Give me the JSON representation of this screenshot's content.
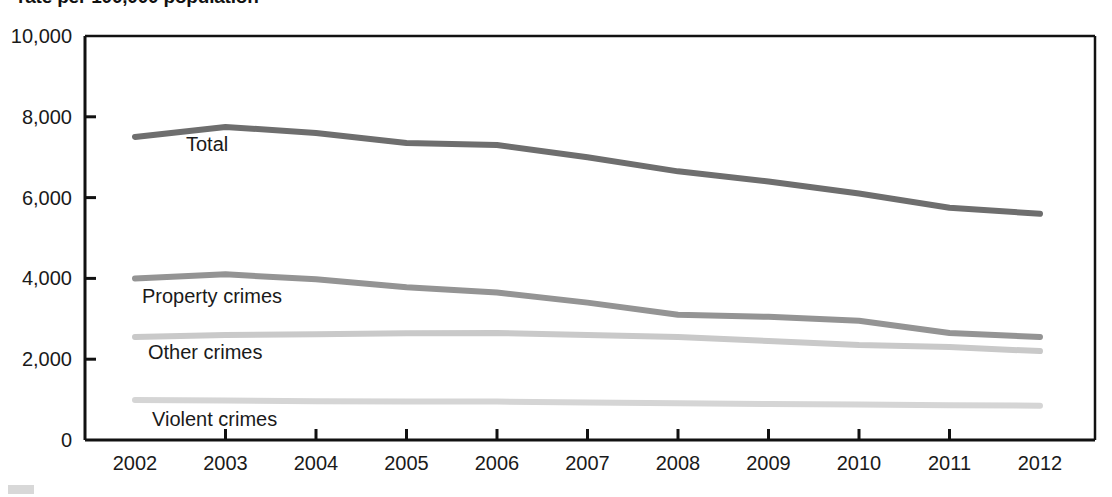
{
  "title": "rate per 100,000 population",
  "axes": {
    "y_ticks": [
      "0",
      "2,000",
      "4,000",
      "6,000",
      "8,000",
      "10,000"
    ],
    "x_ticks": [
      "2002",
      "2003",
      "2004",
      "2005",
      "2006",
      "2007",
      "2008",
      "2009",
      "2010",
      "2011",
      "2012"
    ]
  },
  "series_labels": {
    "total": "Total",
    "property": "Property crimes",
    "other": "Other crimes",
    "violent": "Violent crimes"
  },
  "colors": {
    "total": "#6e6e6e",
    "property": "#949494",
    "other": "#c9c9c9",
    "violent": "#d5d5d5",
    "axis": "#111111"
  },
  "chart_data": {
    "type": "line",
    "title": "rate per 100,000 population",
    "xlabel": "",
    "ylabel": "",
    "x": [
      2002,
      2003,
      2004,
      2005,
      2006,
      2007,
      2008,
      2009,
      2010,
      2011,
      2012
    ],
    "xlim": [
      2002,
      2012
    ],
    "ylim": [
      0,
      10000
    ],
    "ytick_values": [
      0,
      2000,
      4000,
      6000,
      8000,
      10000
    ],
    "grid": false,
    "legend": "inline-labels",
    "series": [
      {
        "name": "Total",
        "color": "#6e6e6e",
        "values": [
          7500,
          7750,
          7600,
          7350,
          7300,
          7000,
          6650,
          6400,
          6100,
          5750,
          5600
        ]
      },
      {
        "name": "Property crimes",
        "color": "#949494",
        "values": [
          4000,
          4100,
          3980,
          3780,
          3650,
          3400,
          3100,
          3050,
          2950,
          2650,
          2550
        ]
      },
      {
        "name": "Other crimes",
        "color": "#c9c9c9",
        "values": [
          2550,
          2600,
          2620,
          2640,
          2650,
          2600,
          2550,
          2450,
          2350,
          2300,
          2200
        ]
      },
      {
        "name": "Violent crimes",
        "color": "#d5d5d5",
        "values": [
          990,
          980,
          960,
          950,
          950,
          930,
          910,
          890,
          880,
          860,
          850
        ]
      }
    ]
  }
}
